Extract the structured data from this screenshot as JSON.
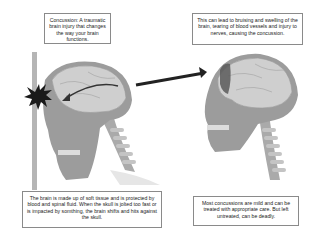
{
  "captions": {
    "definition": "Concussion: A traumatic brain injury that changes the way your brain functions.",
    "effects": "This can lead to bruising and swelling of the brain, tearing of blood vessels and injury to nerves, causing the concussion.",
    "mechanism": "The brain is made up of soft tissue and is protected by blood and spinal fluid. When the skull is jolted too fast or is impacted by somthing, the brain shifts and hits against the skull.",
    "outcome": "Most concussions are mild and can be treated with appropriate care. But left untreated, can be deadly."
  },
  "figures": {
    "left": "skull-impact-against-wall",
    "right": "bruised-brain-frontal-lobe"
  },
  "colors": {
    "skull": "#9c9c9c",
    "brain": "#cfcfcf",
    "wall": "#b5b5b5",
    "impact": "#1a1a1a",
    "arrow": "#222222",
    "bruise": "#5a5a5a"
  }
}
